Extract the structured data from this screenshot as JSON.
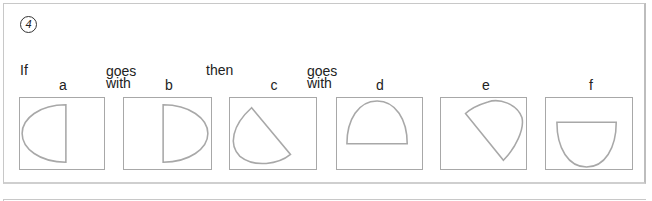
{
  "question_number": "4",
  "words": {
    "if": "If",
    "goes_with_1": [
      "goes",
      "with"
    ],
    "then": "then",
    "goes_with_2": [
      "goes",
      "with"
    ]
  },
  "options": [
    {
      "label": "a",
      "shape": "half-ellipse, flat side right, curve left"
    },
    {
      "label": "b",
      "shape": "half-ellipse, flat side left, curve right"
    },
    {
      "label": "c",
      "shape": "half-ellipse rotated, curve lower-left"
    },
    {
      "label": "d",
      "shape": "half-ellipse, flat side bottom, curve top"
    },
    {
      "label": "e",
      "shape": "half-ellipse rotated, curve upper-right"
    },
    {
      "label": "f",
      "shape": "half-ellipse, flat side top, curve bottom"
    }
  ],
  "colors": {
    "shape_stroke": "#a8a8a8",
    "text": "#222222",
    "frame": "#c8c8c8"
  }
}
